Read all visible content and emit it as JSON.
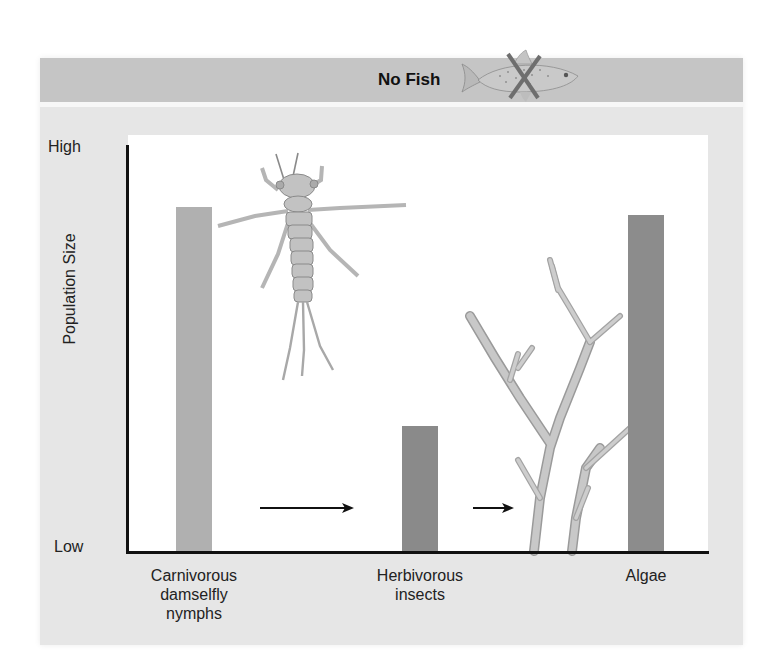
{
  "header": {
    "title": "No Fish",
    "icon": "crossed-out-fish-icon"
  },
  "colors": {
    "header_bg": "#c5c5c5",
    "panel_bg": "#e6e6e6",
    "bar_carnivore": "#b0b0b0",
    "bar_herbivore": "#8a8a8a",
    "bar_algae": "#8c8c8c",
    "cross": "#6e6e6e"
  },
  "axes": {
    "y_title": "Population Size",
    "y_high": "High",
    "y_low": "Low"
  },
  "categories": [
    {
      "line1": "Carnivorous",
      "line2": "damselfly",
      "line3": "nymphs"
    },
    {
      "line1": "Herbivorous",
      "line2": "insects",
      "line3": ""
    },
    {
      "line1": "Algae",
      "line2": "",
      "line3": ""
    }
  ],
  "chart_data": {
    "type": "bar",
    "title": "No Fish",
    "categories": [
      "Carnivorous damselfly nymphs",
      "Herbivorous insects",
      "Algae"
    ],
    "values": [
      0.85,
      0.31,
      0.83
    ],
    "xlabel": "",
    "ylabel": "Population Size",
    "ylim": [
      0,
      1
    ],
    "y_tick_labels": [
      "Low",
      "High"
    ],
    "grid": false,
    "legend": null,
    "annotations": [
      "Arrow from Carnivorous damselfly nymphs to Herbivorous insects",
      "Arrow from Herbivorous insects to Algae",
      "Illustration of damselfly nymph",
      "Illustration of branching algae",
      "Fish illustration crossed out with X"
    ]
  }
}
